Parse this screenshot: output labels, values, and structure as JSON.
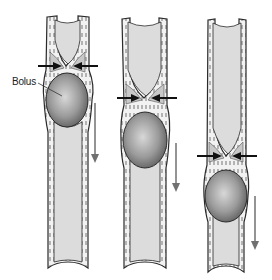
{
  "diagram": {
    "labels": {
      "bolus": "Bolus"
    },
    "colors": {
      "lumen": "#dcdcdc",
      "wall": "#f2f2f2",
      "outline": "#2a2a2a",
      "bolus_light": "#d6d6d6",
      "bolus_dark": "#6e6e6e",
      "arrow": "#111111",
      "motion_arrow": "#707070"
    },
    "stages": [
      {
        "id": "stage-1",
        "constriction_y": 66,
        "bolus_center_y": 100,
        "direction": "down"
      },
      {
        "id": "stage-2",
        "constriction_y": 98,
        "bolus_center_y": 140,
        "direction": "down"
      },
      {
        "id": "stage-3",
        "constriction_y": 156,
        "bolus_center_y": 196,
        "direction": "down"
      }
    ]
  }
}
